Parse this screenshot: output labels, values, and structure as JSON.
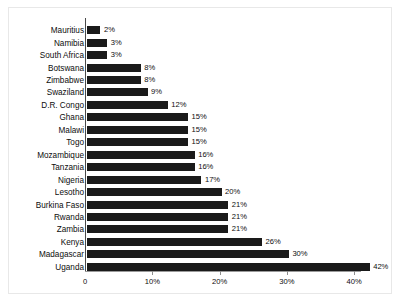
{
  "chart_data": {
    "type": "bar",
    "orientation": "horizontal",
    "title": "",
    "subtitle": "",
    "xlabel": "",
    "ylabel": "",
    "grid": false,
    "legend": null,
    "xlim": [
      0,
      44
    ],
    "x_ticks": [
      {
        "value": 0,
        "label": "0"
      },
      {
        "value": 10,
        "label": "10%"
      },
      {
        "value": 20,
        "label": "20%"
      },
      {
        "value": 30,
        "label": "30%"
      },
      {
        "value": 40,
        "label": "40%"
      }
    ],
    "bar_color": "#1a1a1a",
    "axis_color": "#9a9a9a",
    "categories": [
      "Mauritius",
      "Namibia",
      "South Africa",
      "Botswana",
      "Zimbabwe",
      "Swaziland",
      "D.R. Congo",
      "Ghana",
      "Malawi",
      "Togo",
      "Mozambique",
      "Tanzania",
      "Nigeria",
      "Lesotho",
      "Burkina Faso",
      "Rwanda",
      "Zambia",
      "Kenya",
      "Madagascar",
      "Uganda"
    ],
    "values": [
      2,
      3,
      3,
      8,
      8,
      9,
      12,
      15,
      15,
      15,
      16,
      16,
      17,
      20,
      21,
      21,
      21,
      26,
      30,
      42
    ],
    "value_labels": [
      "2%",
      "3%",
      "3%",
      "8%",
      "8%",
      "9%",
      "12%",
      "15%",
      "15%",
      "15%",
      "16%",
      "16%",
      "17%",
      "20%",
      "21%",
      "21%",
      "21%",
      "26%",
      "30%",
      "42%"
    ]
  }
}
